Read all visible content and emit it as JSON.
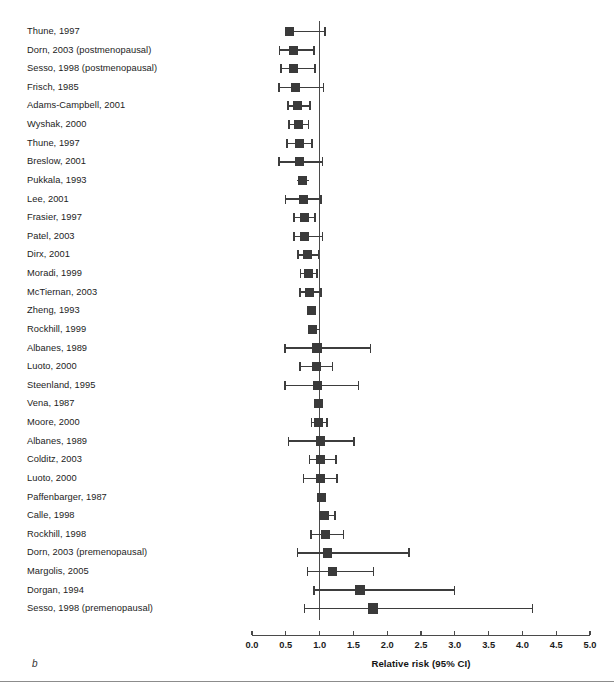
{
  "figure": {
    "panel_letter": "b",
    "axis_title": "Relative risk (95% CI)",
    "marker_color": "#3a3a3a",
    "line_color": "#3d3d3d",
    "ref_line_color": "#4a4a4a",
    "background": "#ffffff"
  },
  "chart_data": {
    "type": "scatter",
    "subtype": "forest-plot",
    "title": "",
    "xlabel": "Relative risk (95% CI)",
    "ylabel": "",
    "xlim": [
      0.0,
      5.0
    ],
    "xticks": [
      0.0,
      0.5,
      1.0,
      1.5,
      2.0,
      2.5,
      3.0,
      3.5,
      4.0,
      4.5,
      5.0
    ],
    "xtick_labels": [
      "0.0",
      "0.5",
      "1.0",
      "1.5",
      "2.0",
      "2.5",
      "3.0",
      "3.5",
      "4.0",
      "4.5",
      "5.0"
    ],
    "grid": false,
    "legend": null,
    "reference_line": 1.0,
    "categories": [
      "Thune, 1997",
      "Dorn, 2003 (postmenopausal)",
      "Sesso, 1998 (postmenopausal)",
      "Frisch, 1985",
      "Adams-Campbell, 2001",
      "Wyshak, 2000",
      "Thune, 1997",
      "Breslow, 2001",
      "Pukkala, 1993",
      "Lee, 2001",
      "Frasier, 1997",
      "Patel, 2003",
      "Dirx, 2001",
      "Moradi, 1999",
      "McTiernan, 2003",
      "Zheng, 1993",
      "Rockhill, 1999",
      "Albanes, 1989",
      "Luoto, 2000",
      "Steenland, 1995",
      "Vena, 1987",
      "Moore, 2000",
      "Albanes, 1989",
      "Colditz, 2003",
      "Luoto, 2000",
      "Paffenbarger, 1987",
      "Calle, 1998",
      "Rockhill, 1998",
      "Dorn, 2003 (premenopausal)",
      "Margolis, 2005",
      "Dorgan, 1994",
      "Sesso, 1998 (premenopausal)"
    ],
    "points": [
      {
        "label": "Thune, 1997",
        "rr": 0.56,
        "ci_low": 0.54,
        "ci_high": 1.08,
        "box": 9.0
      },
      {
        "label": "Dorn, 2003 (postmenopausal)",
        "rr": 0.61,
        "ci_low": 0.41,
        "ci_high": 0.92,
        "box": 9.0
      },
      {
        "label": "Sesso, 1998 (postmenopausal)",
        "rr": 0.62,
        "ci_low": 0.43,
        "ci_high": 0.93,
        "box": 9.0
      },
      {
        "label": "Frisch, 1985",
        "rr": 0.64,
        "ci_low": 0.4,
        "ci_high": 1.06,
        "box": 9.0
      },
      {
        "label": "Adams-Campbell, 2001",
        "rr": 0.68,
        "ci_low": 0.53,
        "ci_high": 0.86,
        "box": 9.0
      },
      {
        "label": "Wyshak, 2000",
        "rr": 0.69,
        "ci_low": 0.55,
        "ci_high": 0.84,
        "box": 9.0
      },
      {
        "label": "Thune, 1997",
        "rr": 0.7,
        "ci_low": 0.52,
        "ci_high": 0.89,
        "box": 9.0
      },
      {
        "label": "Breslow, 2001",
        "rr": 0.71,
        "ci_low": 0.4,
        "ci_high": 1.04,
        "box": 9.0
      },
      {
        "label": "Pukkala, 1993",
        "rr": 0.74,
        "ci_low": 0.66,
        "ci_high": 0.85,
        "box": 9.0
      },
      {
        "label": "Lee, 2001",
        "rr": 0.76,
        "ci_low": 0.5,
        "ci_high": 1.02,
        "box": 9.0
      },
      {
        "label": "Frasier, 1997",
        "rr": 0.77,
        "ci_low": 0.62,
        "ci_high": 0.93,
        "box": 9.0
      },
      {
        "label": "Patel, 2003",
        "rr": 0.78,
        "ci_low": 0.62,
        "ci_high": 1.04,
        "box": 9.0
      },
      {
        "label": "Dirx, 2001",
        "rr": 0.82,
        "ci_low": 0.68,
        "ci_high": 0.98,
        "box": 9.0
      },
      {
        "label": "Moradi, 1999",
        "rr": 0.84,
        "ci_low": 0.72,
        "ci_high": 0.96,
        "box": 9.0
      },
      {
        "label": "McTiernan, 2003",
        "rr": 0.85,
        "ci_low": 0.71,
        "ci_high": 1.02,
        "box": 9.0
      },
      {
        "label": "Zheng, 1993",
        "rr": 0.88,
        "ci_low": 0.87,
        "ci_high": 0.9,
        "box": 9.0
      },
      {
        "label": "Rockhill, 1999",
        "rr": 0.89,
        "ci_low": 0.85,
        "ci_high": 1.0,
        "box": 9.0
      },
      {
        "label": "Albanes, 1989",
        "rr": 0.96,
        "ci_low": 0.49,
        "ci_high": 1.75,
        "box": 9.5
      },
      {
        "label": "Luoto, 2000",
        "rr": 0.96,
        "ci_low": 0.71,
        "ci_high": 1.19,
        "box": 9.0
      },
      {
        "label": "Steenland, 1995",
        "rr": 0.97,
        "ci_low": 0.49,
        "ci_high": 1.58,
        "box": 9.5
      },
      {
        "label": "Vena, 1987",
        "rr": 0.98,
        "ci_low": 0.97,
        "ci_high": 1.0,
        "box": 9.0
      },
      {
        "label": "Moore, 2000",
        "rr": 0.99,
        "ci_low": 0.88,
        "ci_high": 1.11,
        "box": 9.0
      },
      {
        "label": "Albanes, 1989",
        "rr": 1.01,
        "ci_low": 0.54,
        "ci_high": 1.51,
        "box": 9.5
      },
      {
        "label": "Colditz, 2003",
        "rr": 1.02,
        "ci_low": 0.85,
        "ci_high": 1.24,
        "box": 9.0
      },
      {
        "label": "Luoto, 2000",
        "rr": 1.02,
        "ci_low": 0.76,
        "ci_high": 1.26,
        "box": 9.0
      },
      {
        "label": "Paffenbarger, 1987",
        "rr": 1.03,
        "ci_low": 1.02,
        "ci_high": 1.05,
        "box": 9.0
      },
      {
        "label": "Calle, 1998",
        "rr": 1.07,
        "ci_low": 1.0,
        "ci_high": 1.23,
        "box": 9.0
      },
      {
        "label": "Rockhill, 1998",
        "rr": 1.09,
        "ci_low": 0.87,
        "ci_high": 1.35,
        "box": 9.0
      },
      {
        "label": "Dorn, 2003 (premenopausal)",
        "rr": 1.12,
        "ci_low": 0.67,
        "ci_high": 2.32,
        "box": 9.5
      },
      {
        "label": "Margolis, 2005",
        "rr": 1.19,
        "ci_low": 0.82,
        "ci_high": 1.8,
        "box": 9.5
      },
      {
        "label": "Dorgan, 1994",
        "rr": 1.6,
        "ci_low": 0.92,
        "ci_high": 3.0,
        "box": 10.0
      },
      {
        "label": "Sesso, 1998 (premenopausal)",
        "rr": 1.79,
        "ci_low": 0.78,
        "ci_high": 4.15,
        "box": 10.5
      }
    ]
  }
}
